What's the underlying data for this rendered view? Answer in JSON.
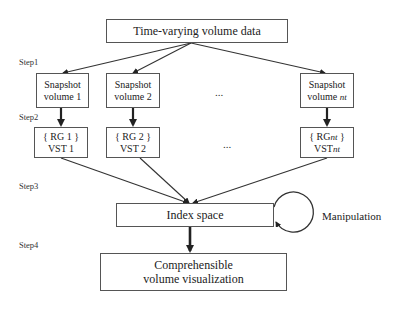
{
  "diagram": {
    "top_box": {
      "label": "Time-varying volume data"
    },
    "steps": [
      "Step1",
      "Step2",
      "Step3",
      "Step4"
    ],
    "snapshots": [
      {
        "line1": "Snapshot",
        "line2": "volume 1",
        "sub": ""
      },
      {
        "line1": "Snapshot",
        "line2": "volume 2",
        "sub": ""
      },
      {
        "line1": "Snapshot",
        "line2": "volume ",
        "sub": "nt"
      }
    ],
    "rg_boxes": [
      {
        "line1": "{ RG 1 }",
        "line2": "VST 1",
        "sub": ""
      },
      {
        "line1": "{ RG 2 }",
        "line2": "VST 2",
        "sub": ""
      },
      {
        "line1_pre": "{ RG",
        "line1_post": " }",
        "line2": "VST",
        "sub": "nt"
      }
    ],
    "ellipsis": "...",
    "index_box": {
      "label": "Index space"
    },
    "manipulation_label": "Manipulation",
    "output_box": {
      "line1": "Comprehensible",
      "line2": "volume visualization"
    },
    "colors": {
      "stroke": "#333333",
      "box_border": "#555555",
      "background": "#ffffff"
    }
  }
}
